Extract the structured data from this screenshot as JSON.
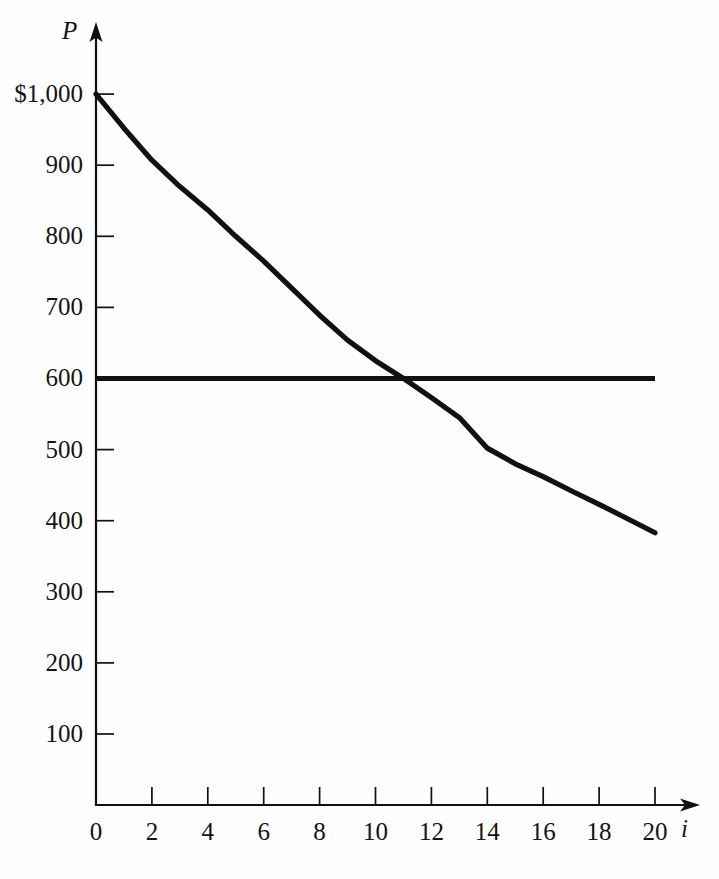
{
  "chart_data": {
    "type": "line",
    "title": "",
    "subtitle": "",
    "xlabel": "i",
    "ylabel": "P",
    "xlim": [
      0,
      20
    ],
    "ylim": [
      0,
      1000
    ],
    "grid": false,
    "legend": "none",
    "annotations": [],
    "x_ticks": [
      {
        "value": 0,
        "label": "0"
      },
      {
        "value": 2,
        "label": "2"
      },
      {
        "value": 4,
        "label": "4"
      },
      {
        "value": 6,
        "label": "6"
      },
      {
        "value": 8,
        "label": "8"
      },
      {
        "value": 10,
        "label": "10"
      },
      {
        "value": 12,
        "label": "12"
      },
      {
        "value": 14,
        "label": "14"
      },
      {
        "value": 16,
        "label": "16"
      },
      {
        "value": 18,
        "label": "18"
      },
      {
        "value": 20,
        "label": "20"
      }
    ],
    "y_ticks": [
      {
        "value": 100,
        "label": "100"
      },
      {
        "value": 200,
        "label": "200"
      },
      {
        "value": 300,
        "label": "300"
      },
      {
        "value": 400,
        "label": "400"
      },
      {
        "value": 500,
        "label": "500"
      },
      {
        "value": 600,
        "label": "600"
      },
      {
        "value": 700,
        "label": "700"
      },
      {
        "value": 800,
        "label": "800"
      },
      {
        "value": 900,
        "label": "900"
      },
      {
        "value": 1000,
        "label": "$1,000"
      }
    ],
    "series": [
      {
        "name": "bond-price-curve",
        "type": "line",
        "color": "#111111",
        "x": [
          0,
          1,
          2,
          3,
          4,
          5,
          6,
          7,
          8,
          9,
          10,
          11,
          12,
          13,
          14,
          15,
          16,
          17,
          18,
          19,
          20
        ],
        "values": [
          1000,
          952,
          907,
          870,
          837,
          800,
          765,
          727,
          689,
          654,
          625,
          600,
          573,
          545,
          502,
          480,
          462,
          442,
          423,
          403,
          383
        ]
      },
      {
        "name": "face-value-line",
        "type": "line",
        "color": "#111111",
        "x": [
          0,
          20
        ],
        "values": [
          600,
          600
        ]
      }
    ],
    "intersection": {
      "x": 11,
      "y": 600
    }
  },
  "axes": {
    "y_axis_label": "P",
    "x_axis_label": "i"
  }
}
